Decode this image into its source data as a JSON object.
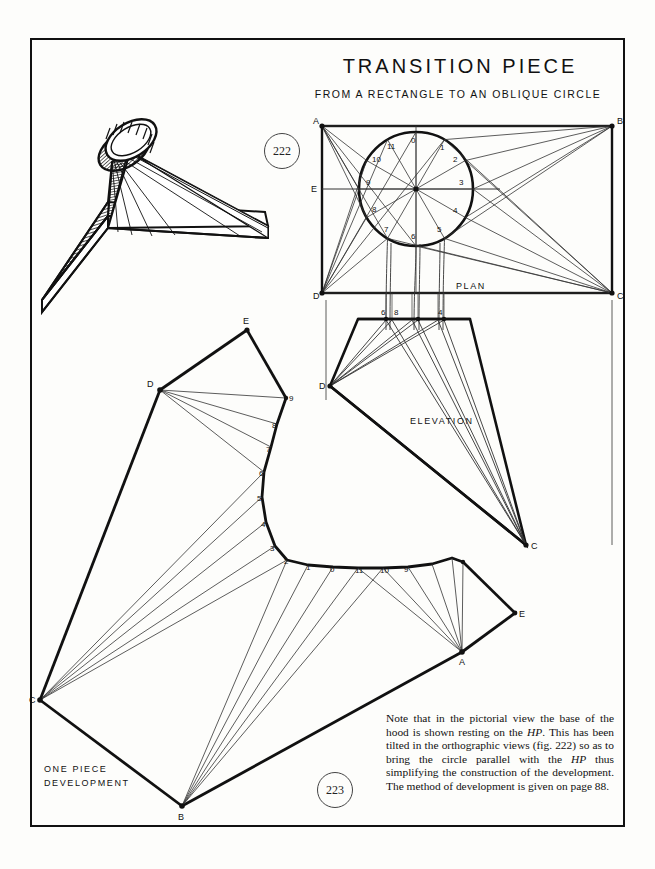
{
  "page": {
    "title": "TRANSITION PIECE",
    "subtitle": "FROM A RECTANGLE TO AN OBLIQUE CIRCLE",
    "figures": [
      {
        "id": "fig-222",
        "number": "222"
      },
      {
        "id": "fig-223",
        "number": "223"
      }
    ],
    "view_labels": {
      "plan": "PLAN",
      "elevation": "ELEVATION",
      "development_line1": "ONE  PIECE",
      "development_line2": "DEVELOPMENT"
    },
    "note": {
      "line1": "Note that in the pictorial view the base of",
      "line2": "the hood is shown resting on the ",
      "line2_italic": "HP",
      "line2_end": ".",
      "line3": "This has been tilted in the orthographic",
      "line4": "views (fig. 222) so as to bring the circle",
      "line5": "parallel with the ",
      "line5_italic": "HP",
      "line5_end": " thus simplifying the",
      "line6": "construction of the development.  The",
      "line7": "method of development is given on page 88."
    }
  },
  "plan": {
    "corners": [
      {
        "label": "A",
        "x": 322,
        "y": 126
      },
      {
        "label": "B",
        "x": 612,
        "y": 126
      },
      {
        "label": "C",
        "x": 612,
        "y": 293
      },
      {
        "label": "D",
        "x": 322,
        "y": 293
      }
    ],
    "mid_left_label": {
      "label": "E",
      "x": 322,
      "y": 188
    },
    "circle": {
      "cx": 416,
      "cy": 189,
      "r": 57
    },
    "circle_point_labels": [
      "0",
      "1",
      "2",
      "3",
      "4",
      "5",
      "6",
      "7",
      "8",
      "9",
      "10",
      "11"
    ]
  },
  "elevation": {
    "apex_labels": [
      "6",
      "8",
      "4"
    ],
    "corner_labels": [
      "D",
      "C"
    ]
  },
  "development": {
    "vertex_labels": [
      "E",
      "D",
      "C",
      "B",
      "A",
      "E"
    ],
    "curve_labels_left": [
      "9",
      "8",
      "7",
      "6",
      "5",
      "4",
      "3",
      "2"
    ],
    "curve_labels_bottom": [
      "1",
      "0",
      "11",
      "10",
      "9"
    ]
  },
  "colors": {
    "ink": "#111111",
    "thin": "#333333",
    "paper": "#fdfdfb"
  }
}
